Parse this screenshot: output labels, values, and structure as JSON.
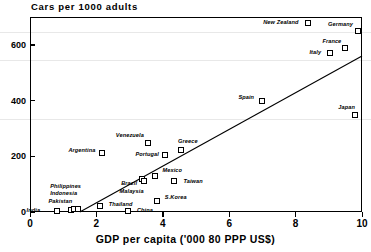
{
  "chart_data": {
    "type": "scatter",
    "title": "Cars per 1000 adults",
    "xlabel": "GDP per capita ('000 80 PPP US$)",
    "ylabel": "Cars per 1000 adults",
    "xlim": [
      0,
      10
    ],
    "ylim": [
      0,
      700
    ],
    "xticks": [
      "0",
      "2",
      "4",
      "6",
      "8",
      "10"
    ],
    "xtick_values": [
      0,
      2,
      4,
      6,
      8,
      10
    ],
    "yticks": [
      "0",
      "200",
      "400",
      "600"
    ],
    "ytick_values": [
      0,
      200,
      400,
      600
    ],
    "grid": false,
    "legend": "none",
    "marker": "open-square",
    "points": [
      {
        "name": "India",
        "x": 0.8,
        "y": 5,
        "lx": -30,
        "ly": -1
      },
      {
        "name": "Pakistan",
        "x": 1.22,
        "y": 8,
        "lx": -22,
        "ly": -9
      },
      {
        "name": "Indonesia",
        "x": 1.33,
        "y": 10,
        "lx": -24,
        "ly": -16
      },
      {
        "name": "Philippines",
        "x": 1.45,
        "y": 12,
        "lx": -28,
        "ly": -23
      },
      {
        "name": "Thailand",
        "x": 2.1,
        "y": 22,
        "lx": 9,
        "ly": -2
      },
      {
        "name": "China",
        "x": 2.95,
        "y": 5,
        "lx": 9,
        "ly": -1
      },
      {
        "name": "Argentina",
        "x": 2.18,
        "y": 212,
        "lx": -34,
        "ly": -3
      },
      {
        "name": "Brazil",
        "x": 3.38,
        "y": 118,
        "lx": -21,
        "ly": 4
      },
      {
        "name": "Malaysia",
        "x": 3.42,
        "y": 112,
        "lx": -24,
        "ly": 10
      },
      {
        "name": "Mexico",
        "x": 3.75,
        "y": 128,
        "lx": 8,
        "ly": -6
      },
      {
        "name": "S.Korea",
        "x": 3.82,
        "y": 40,
        "lx": 8,
        "ly": -4
      },
      {
        "name": "Taiwan",
        "x": 4.35,
        "y": 110,
        "lx": 9,
        "ly": 0
      },
      {
        "name": "Venezuela",
        "x": 3.55,
        "y": 248,
        "lx": -32,
        "ly": -8
      },
      {
        "name": "Portugal",
        "x": 4.08,
        "y": 205,
        "lx": -30,
        "ly": -1
      },
      {
        "name": "Greece",
        "x": 4.55,
        "y": 222,
        "lx": -3,
        "ly": -9
      },
      {
        "name": "Spain",
        "x": 7.0,
        "y": 398,
        "lx": -24,
        "ly": -4
      },
      {
        "name": "Italy",
        "x": 9.05,
        "y": 572,
        "lx": -21,
        "ly": -1
      },
      {
        "name": "France",
        "x": 9.5,
        "y": 590,
        "lx": -23,
        "ly": -7
      },
      {
        "name": "Germany",
        "x": 9.88,
        "y": 648,
        "lx": -30,
        "ly": -7
      },
      {
        "name": "New Zealand",
        "x": 8.38,
        "y": 678,
        "lx": -45,
        "ly": -1
      },
      {
        "name": "Japan",
        "x": 9.8,
        "y": 348,
        "lx": -17,
        "ly": -8
      }
    ],
    "fit_line": {
      "x0": 1.5,
      "y0": 0,
      "x1": 10.0,
      "y1": 560
    }
  }
}
